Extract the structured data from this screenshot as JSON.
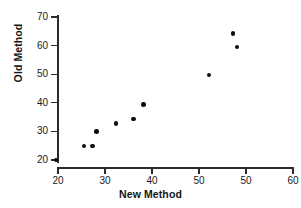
{
  "chart_data": {
    "type": "scatter",
    "title": "",
    "xlabel": "New Method",
    "ylabel": "Old Method",
    "xlim": [
      15,
      62
    ],
    "ylim": [
      16,
      72
    ],
    "xticks": [
      20,
      30,
      40,
      50,
      50,
      60
    ],
    "xtick_labels": [
      "20",
      "30",
      "40",
      "50",
      "50",
      "60"
    ],
    "yticks": [
      20,
      30,
      40,
      50,
      60,
      70
    ],
    "ytick_labels": [
      "20",
      "30",
      "40",
      "50",
      "60",
      "70"
    ],
    "grid": false,
    "legend": null,
    "marker": "filled-circle",
    "marker_color": "#0d0d0d",
    "points": [
      {
        "x": 19.6,
        "y": 19.9
      },
      {
        "x": 25.5,
        "y": 24.9
      },
      {
        "x": 27.3,
        "y": 24.8
      },
      {
        "x": 28.2,
        "y": 29.9
      },
      {
        "x": 32.4,
        "y": 32.8
      },
      {
        "x": 36.1,
        "y": 34.4
      },
      {
        "x": 38.2,
        "y": 39.4
      },
      {
        "x": 52.1,
        "y": 49.7
      },
      {
        "x": 58.1,
        "y": 59.6
      },
      {
        "x": 57.2,
        "y": 64.3
      }
    ]
  }
}
